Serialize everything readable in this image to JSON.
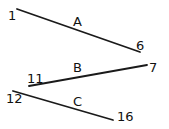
{
  "diagram": {
    "segments": [
      {
        "name": "A",
        "start_label": "1",
        "end_label": "6",
        "x1": 17,
        "y1": 9,
        "x2": 140,
        "y2": 52,
        "name_pos": [
          73,
          26
        ],
        "start_pos": [
          8,
          20
        ],
        "end_pos": [
          136,
          50
        ]
      },
      {
        "name": "B",
        "start_label": "11",
        "end_label": "7",
        "x1": 29,
        "y1": 86,
        "x2": 147,
        "y2": 65,
        "name_pos": [
          73,
          72
        ],
        "start_pos": [
          27,
          83
        ],
        "end_pos": [
          149,
          72
        ]
      },
      {
        "name": "C",
        "start_label": "12",
        "end_label": "16",
        "x1": 13,
        "y1": 91,
        "x2": 113,
        "y2": 120,
        "name_pos": [
          73,
          106
        ],
        "start_pos": [
          6,
          103
        ],
        "end_pos": [
          117,
          121
        ]
      }
    ],
    "stroke_color": "#1a1a1a",
    "background": "#ffffff"
  }
}
